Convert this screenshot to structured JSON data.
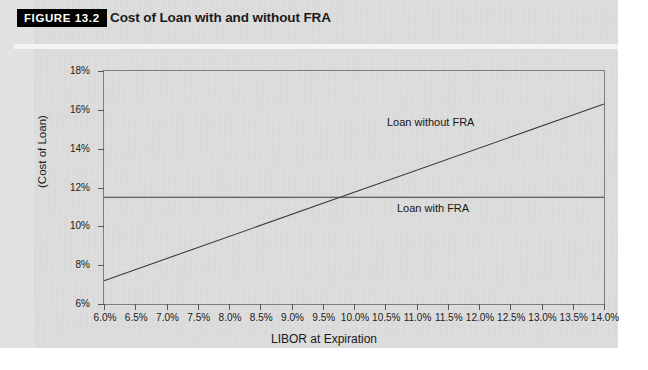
{
  "figure": {
    "tag": "FIGURE 13.2",
    "title": "Cost of Loan with and without FRA"
  },
  "chart_data": {
    "type": "line",
    "title": "Cost of Loan with and without FRA",
    "xlabel": "LIBOR at Expiration",
    "ylabel": "(Cost of Loan)",
    "xlim": [
      6.0,
      14.0
    ],
    "ylim": [
      6,
      18
    ],
    "grid": false,
    "legend_position": "inline-annotation",
    "x_tick_labels": [
      "6.0%",
      "6.5%",
      "7.0%",
      "7.5%",
      "8.0%",
      "8.5%",
      "9.0%",
      "9.5%",
      "10.0%",
      "10.5%",
      "11.0%",
      "11.5%",
      "12.0%",
      "12.5%",
      "13.0%",
      "13.5%",
      "14.0%"
    ],
    "y_tick_labels": [
      "6%",
      "8%",
      "10%",
      "12%",
      "14%",
      "16%",
      "18%"
    ],
    "x": [
      6.0,
      6.5,
      7.0,
      7.5,
      8.0,
      8.5,
      9.0,
      9.5,
      10.0,
      10.5,
      11.0,
      11.5,
      12.0,
      12.5,
      13.0,
      13.5,
      14.0
    ],
    "series": [
      {
        "name": "Loan without FRA",
        "annotation": "Loan without FRA",
        "values": [
          7.2,
          7.77,
          8.34,
          8.91,
          9.48,
          10.05,
          10.62,
          11.19,
          11.5,
          12.33,
          12.9,
          13.47,
          14.04,
          14.61,
          15.18,
          15.75,
          16.3
        ]
      },
      {
        "name": "Loan with FRA",
        "annotation": "Loan with FRA",
        "values": [
          11.5,
          11.5,
          11.5,
          11.5,
          11.5,
          11.5,
          11.5,
          11.5,
          11.5,
          11.5,
          11.5,
          11.5,
          11.5,
          11.5,
          11.5,
          11.5,
          11.5
        ]
      }
    ],
    "crossover": {
      "x": 10.0,
      "y": 11.5
    },
    "colors": {
      "line": "#3a3a42",
      "axis": "#7d7d84",
      "background": "#dedede"
    }
  }
}
